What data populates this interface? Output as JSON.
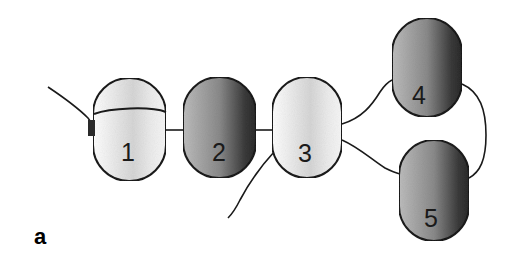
{
  "figure": {
    "panel_label": "a",
    "cells": [
      {
        "id": "cell-1",
        "label": "1",
        "shade": "light",
        "x": 93,
        "y": 78,
        "w": 73,
        "h": 103
      },
      {
        "id": "cell-2",
        "label": "2",
        "shade": "dark",
        "x": 183,
        "y": 77,
        "w": 73,
        "h": 101
      },
      {
        "id": "cell-3",
        "label": "3",
        "shade": "light",
        "x": 272,
        "y": 77,
        "w": 70,
        "h": 101
      },
      {
        "id": "cell-4",
        "label": "4",
        "shade": "dark",
        "x": 392,
        "y": 18,
        "w": 70,
        "h": 99
      },
      {
        "id": "cell-5",
        "label": "5",
        "shade": "dark",
        "x": 399,
        "y": 140,
        "w": 70,
        "h": 101
      }
    ],
    "colors": {
      "outline": "#1a1a1a",
      "light_fill_edge": "#ffffff",
      "light_fill_mid": "#d8d8d8",
      "dark_fill_light": "#b8b8b8",
      "dark_fill_dark": "#2a2a2a"
    }
  }
}
